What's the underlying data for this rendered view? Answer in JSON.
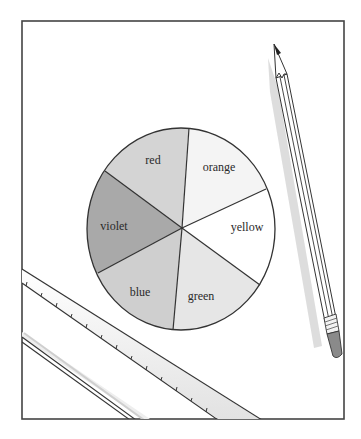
{
  "diagram": {
    "type": "color-wheel-illustration",
    "wheel": {
      "center": [
        181,
        229
      ],
      "rx": 94,
      "ry": 101,
      "segments": [
        {
          "label": "red",
          "fill": "#d4d4d4",
          "label_pos": [
            153,
            164
          ]
        },
        {
          "label": "orange",
          "fill": "#f4f4f4",
          "label_pos": [
            219,
            171
          ]
        },
        {
          "label": "yellow",
          "fill": "#ffffff",
          "label_pos": [
            247,
            231
          ]
        },
        {
          "label": "green",
          "fill": "#e6e6e6",
          "label_pos": [
            201,
            300
          ]
        },
        {
          "label": "blue",
          "fill": "#cfcfcf",
          "label_pos": [
            140,
            296
          ]
        },
        {
          "label": "violet",
          "fill": "#a9a9a9",
          "label_pos": [
            114,
            230
          ]
        }
      ]
    },
    "objects": {
      "paper": "paper-sheet",
      "pencil": "pencil",
      "ruler_1": "ruler",
      "ruler_2": "ruler"
    },
    "colors": {
      "line": "#333333",
      "paper_edge": "#444444",
      "shadow": "#d9d9d9",
      "eraser": "#8a8a8a",
      "pencil_lead": "#222222"
    }
  }
}
